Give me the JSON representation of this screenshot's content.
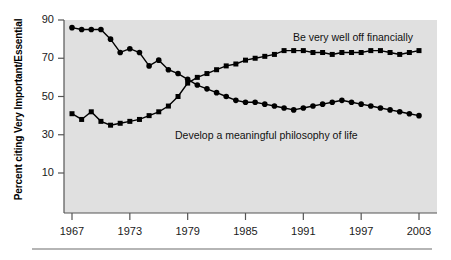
{
  "axes": {
    "ylabel": "Percent citing Very Important/Essential",
    "yticks": [
      90,
      70,
      50,
      30,
      10
    ],
    "xticks": [
      1967,
      1973,
      1979,
      1985,
      1991,
      1997,
      2003
    ],
    "plot_background": "#e0e0e0",
    "axis_color": "#555555",
    "series_color": "#000000"
  },
  "labels": {
    "financial": "Be very well off financially",
    "philosophy": "Develop a meaningful philosophy of life"
  },
  "chart_data": {
    "type": "line",
    "title": "",
    "xlabel": "",
    "ylabel": "Percent citing Very Important/Essential",
    "xlim": [
      1966,
      2004
    ],
    "ylim": [
      0,
      90
    ],
    "grid": false,
    "legend": "inline-annotations",
    "x": [
      1967,
      1968,
      1969,
      1970,
      1971,
      1972,
      1973,
      1974,
      1975,
      1976,
      1977,
      1978,
      1979,
      1980,
      1981,
      1982,
      1983,
      1984,
      1985,
      1986,
      1987,
      1988,
      1989,
      1990,
      1991,
      1992,
      1993,
      1994,
      1995,
      1996,
      1997,
      1998,
      1999,
      2000,
      2001,
      2002,
      2003
    ],
    "series": [
      {
        "name": "Develop a meaningful philosophy of life",
        "marker": "circle",
        "values": [
          86,
          85,
          85,
          85,
          80,
          73,
          75,
          73,
          66,
          69,
          64,
          62,
          59,
          56,
          54,
          52,
          50,
          48,
          47,
          47,
          46,
          45,
          44,
          43,
          44,
          45,
          46,
          47,
          48,
          47,
          46,
          45,
          44,
          43,
          42,
          41,
          40
        ]
      },
      {
        "name": "Be very well off financially",
        "marker": "square",
        "values": [
          41,
          38,
          42,
          37,
          35,
          36,
          37,
          38,
          40,
          42,
          45,
          50,
          57,
          60,
          62,
          64,
          66,
          67,
          69,
          70,
          71,
          72,
          74,
          74,
          74,
          73,
          73,
          72,
          73,
          73,
          73,
          74,
          74,
          73,
          72,
          73,
          74
        ]
      }
    ]
  }
}
